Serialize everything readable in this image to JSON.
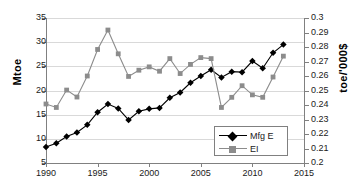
{
  "chart_data": {
    "type": "line",
    "title": "",
    "xlabel": "",
    "ylabel": "Mtoe",
    "y2label": "toe/'000$",
    "x": [
      1990,
      1991,
      1992,
      1993,
      1994,
      1995,
      1996,
      1997,
      1998,
      1999,
      2000,
      2001,
      2002,
      2003,
      2004,
      2005,
      2006,
      2007,
      2008,
      2009,
      2010,
      2011,
      2012,
      2013
    ],
    "xlim": [
      1990,
      2015
    ],
    "ylim": [
      5,
      35
    ],
    "y2lim": [
      0.2,
      0.3
    ],
    "xticks": [
      1990,
      1995,
      2000,
      2005,
      2010,
      2015
    ],
    "yticks": [
      5,
      10,
      15,
      20,
      25,
      30,
      35
    ],
    "y2ticks": [
      0.2,
      0.21,
      0.22,
      0.23,
      0.24,
      0.25,
      0.26,
      0.27,
      0.28,
      0.29,
      0.3
    ],
    "grid": true,
    "legend_position": "bottom-right",
    "series": [
      {
        "name": "Mfg E",
        "axis": "left",
        "unit": "Mtoe",
        "color": "#000000",
        "marker": "diamond",
        "values": [
          8.3,
          9.1,
          10.5,
          11.3,
          12.9,
          15.5,
          17.2,
          16.3,
          13.9,
          15.7,
          16.2,
          16.4,
          18.5,
          19.6,
          21.6,
          23.0,
          24.3,
          22.7,
          23.9,
          23.8,
          26.1,
          24.6,
          27.8,
          29.5
        ]
      },
      {
        "name": "EI",
        "axis": "right",
        "unit": "toe/'000$",
        "color": "#8c8c8c",
        "marker": "square",
        "values": [
          0.2407,
          0.2383,
          0.2503,
          0.2455,
          0.26,
          0.2783,
          0.2917,
          0.2753,
          0.2597,
          0.264,
          0.2663,
          0.2633,
          0.272,
          0.2617,
          0.268,
          0.2727,
          0.272,
          0.2383,
          0.2453,
          0.2533,
          0.247,
          0.2453,
          0.2593,
          0.2737
        ]
      }
    ]
  }
}
